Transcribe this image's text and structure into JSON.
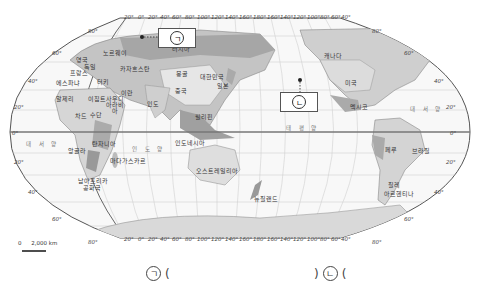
{
  "map": {
    "top_longitudes": [
      "20°",
      "0°",
      "20°",
      "40°",
      "60°",
      "80°",
      "100°",
      "120°",
      "140°",
      "160°",
      "180°",
      "160°",
      "140°",
      "120°",
      "100°",
      "80°",
      "60°",
      "40°"
    ],
    "bottom_longitudes": [
      "20°",
      "0°",
      "20°",
      "40°",
      "60°",
      "80°",
      "100°",
      "120°",
      "140°",
      "160°",
      "180°",
      "160°",
      "140°",
      "120°",
      "100°",
      "80°",
      "60°",
      "40°"
    ],
    "left_latitudes": {
      "n80": "80°",
      "n60": "60°",
      "n40": "40°",
      "n20": "20°",
      "eq": "0°",
      "s20": "20°",
      "s40": "40°",
      "s60": "60°",
      "s80": "80°"
    },
    "right_latitudes": {
      "n80": "80°",
      "n60": "60°",
      "n40": "40°",
      "n20": "20°",
      "eq": "0°",
      "s20": "20°",
      "s40": "40°",
      "s60": "60°",
      "s80": "80°"
    },
    "oceans": {
      "atlantic_left": "대 서 양",
      "atlantic_right": "대 서 양",
      "indian": "인 도 양",
      "pacific": "태 평 양"
    },
    "countries": {
      "russia": "러시아",
      "kazakhstan": "카자흐스탄",
      "mongolia": "몽골",
      "china": "중국",
      "korea": "대한민국",
      "japan": "일본",
      "india": "인도",
      "iran": "이란",
      "turkey": "터키",
      "egypt": "이집트",
      "saudi": "사우디\n아라비아",
      "sudan": "수단",
      "chad": "차드",
      "algeria": "알제리",
      "angola": "앙골라",
      "tanzania": "탄자니아",
      "madagascar": "마다가스카르",
      "south_africa_1": "남아프리카",
      "south_africa_2": "공화국",
      "philippines": "필리핀",
      "indonesia": "인도네시아",
      "australia": "오스트레일리아",
      "new_zealand": "뉴질랜드",
      "canada": "캐나다",
      "usa": "미국",
      "mexico": "멕시코",
      "peru": "페루",
      "brazil": "브라질",
      "chile": "칠레",
      "argentina": "아르헨티나",
      "spain": "에스파냐",
      "france": "프랑스",
      "uk": "영국",
      "germany": "독일",
      "norway": "노르웨이"
    },
    "markers": {
      "a": "ㄱ",
      "b": "ㄴ"
    },
    "scale": {
      "zero": "0",
      "distance": "2,000 km"
    }
  },
  "answers": {
    "a_label": "ㄱ",
    "a_open": "(",
    "a_close": ")",
    "b_label": "ㄴ",
    "b_open": "("
  },
  "colors": {
    "land_light": "#dcdcdc",
    "land_mid": "#bdbdbd",
    "land_dark": "#9a9a9a",
    "ocean": "#f7f7f7",
    "grid": "#c8c8c8",
    "outline": "#666666",
    "equator": "#777777"
  }
}
